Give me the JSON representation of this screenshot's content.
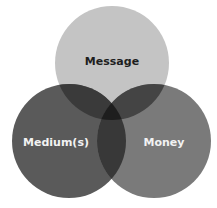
{
  "diagram": {
    "type": "venn",
    "circles": [
      {
        "id": "message",
        "label": "Message",
        "cx": 112,
        "cy": 63,
        "r": 57,
        "fill": "#c4c4c4",
        "text_color": "#1e1e1e"
      },
      {
        "id": "medium",
        "label": "Medium(s)",
        "cx": 69,
        "cy": 141,
        "r": 57,
        "fill": "#5a5a5a",
        "text_color": "#f2f2f2"
      },
      {
        "id": "money",
        "label": "Money",
        "cx": 154,
        "cy": 141,
        "r": 57,
        "fill": "#7a7a7a",
        "text_color": "#f2f2f2"
      }
    ],
    "overlap_colors": {
      "message_medium": "#3a3a3a",
      "message_money": "#444444",
      "medium_money": "#383838",
      "all": "#1e1e1e"
    }
  }
}
